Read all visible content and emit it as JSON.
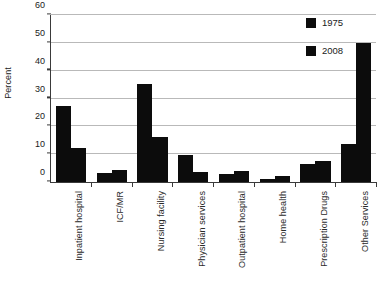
{
  "chart_data": {
    "type": "bar",
    "title": "",
    "xlabel": "",
    "ylabel": "Percent",
    "ylim": [
      0,
      60
    ],
    "yticks": [
      0,
      10,
      20,
      30,
      40,
      50,
      60
    ],
    "grid": true,
    "legend_position": "top-right",
    "categories": [
      "Inpatient hospital",
      "ICF/MR",
      "Nursing facility",
      "Physician services",
      "Outpatient hospital",
      "Home health",
      "Prescription Drugs",
      "Other Services"
    ],
    "series": [
      {
        "name": "1975",
        "color": "#0c0c0c",
        "values": [
          27.3,
          3.2,
          35.2,
          9.7,
          3.0,
          1.0,
          6.4,
          13.8
        ]
      },
      {
        "name": "2008",
        "color": "#0c0c0c",
        "values": [
          12.3,
          4.2,
          16.0,
          3.5,
          3.8,
          2.0,
          7.5,
          50.0
        ]
      }
    ]
  },
  "legend": {
    "items": [
      {
        "label": "1975"
      },
      {
        "label": "2008"
      }
    ]
  },
  "axes": {
    "y_title": "Percent"
  }
}
